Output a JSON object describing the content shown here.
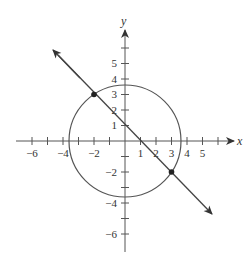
{
  "figure": {
    "colors": {
      "background": "#ffffff",
      "stroke": "#444444",
      "text": "#333333"
    },
    "axes": {
      "x_label": "x",
      "y_label": "y",
      "x_tick_labels": [
        "−6",
        "−4",
        "−2",
        "1",
        "2",
        "3",
        "4",
        "5"
      ],
      "y_tick_labels": [
        "5",
        "4",
        "3",
        "2",
        "1",
        "−2",
        "−4",
        "−6"
      ]
    },
    "circle": {
      "center": [
        0,
        0
      ],
      "radius_squared": 13
    },
    "line": {
      "slope": -1,
      "intercept": 1
    },
    "intersection_points": [
      {
        "x": -2,
        "y": 3
      },
      {
        "x": 3,
        "y": -2
      }
    ]
  }
}
